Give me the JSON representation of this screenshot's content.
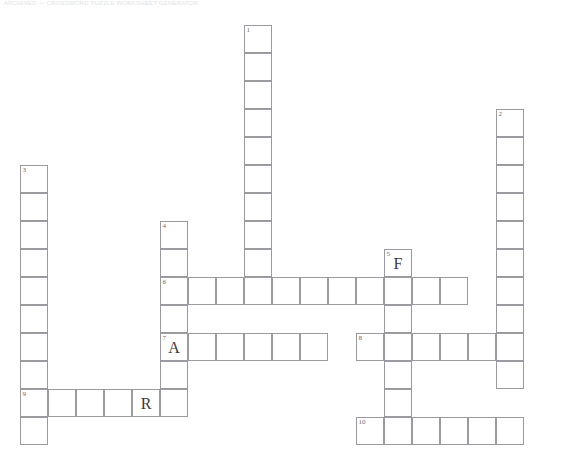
{
  "page": {
    "header_text": "ARCHIVED  —  CROSSWORD  PUZZLE  WORKSHEET  GENERATOR",
    "background_color": "#ffffff",
    "grid_line_color": "#9a9aa2",
    "letter_color": "#3a3a3a",
    "number_color": "#6a6a72"
  },
  "grid": {
    "cell_size": 28,
    "origin_x": 20,
    "origin_y": 25,
    "columns": 20,
    "rows": 16
  },
  "entries": [
    {
      "number": "1",
      "direction": "down",
      "col": 8,
      "row": 0,
      "length": 10
    },
    {
      "number": "2",
      "direction": "down",
      "col": 17,
      "row": 3,
      "length": 10
    },
    {
      "number": "3",
      "direction": "down",
      "col": 0,
      "row": 5,
      "length": 10
    },
    {
      "number": "4",
      "direction": "down",
      "col": 5,
      "row": 7,
      "length": 7
    },
    {
      "number": "5",
      "direction": "down",
      "col": 13,
      "row": 8,
      "length": 7
    },
    {
      "number": "6",
      "direction": "across",
      "col": 5,
      "row": 9,
      "length": 11
    },
    {
      "number": "7",
      "direction": "across",
      "col": 5,
      "row": 11,
      "length": 6
    },
    {
      "number": "8",
      "direction": "across",
      "col": 12,
      "row": 11,
      "length": 5
    },
    {
      "number": "9",
      "direction": "across",
      "col": 0,
      "row": 13,
      "length": 6
    },
    {
      "number": "10",
      "direction": "across",
      "col": 12,
      "row": 14,
      "length": 6
    }
  ],
  "filled_letters": [
    {
      "letter": "F",
      "col": 13,
      "row": 8
    },
    {
      "letter": "A",
      "col": 5,
      "row": 11
    },
    {
      "letter": "R",
      "col": 4,
      "row": 13
    }
  ],
  "clue_numbers": [
    {
      "number": "1",
      "col": 8,
      "row": 0
    },
    {
      "number": "2",
      "col": 17,
      "row": 3
    },
    {
      "number": "3",
      "col": 0,
      "row": 5
    },
    {
      "number": "4",
      "col": 5,
      "row": 7
    },
    {
      "number": "5",
      "col": 13,
      "row": 8
    },
    {
      "number": "6",
      "col": 5,
      "row": 9
    },
    {
      "number": "7",
      "col": 5,
      "row": 11
    },
    {
      "number": "8",
      "col": 12,
      "row": 11
    },
    {
      "number": "9",
      "col": 0,
      "row": 13
    },
    {
      "number": "10",
      "col": 12,
      "row": 14
    }
  ]
}
